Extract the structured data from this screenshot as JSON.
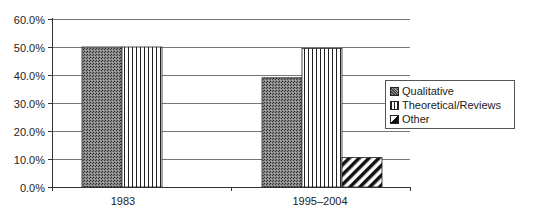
{
  "chart_data": {
    "type": "bar",
    "title": "",
    "xlabel": "",
    "ylabel": "",
    "categories": [
      "1983",
      "1995–2004"
    ],
    "series": [
      {
        "name": "Qualitative",
        "values": [
          50.0,
          39.0
        ],
        "pattern": "dots",
        "color": "#6a6a6a"
      },
      {
        "name": "Theoretical/Reviews",
        "values": [
          50.0,
          49.5
        ],
        "pattern": "vertical-lines",
        "color": "#ffffff"
      },
      {
        "name": "Other",
        "values": [
          null,
          10.5
        ],
        "pattern": "diagonal-lines",
        "color": "#ffffff"
      }
    ],
    "ylim": [
      0,
      60
    ],
    "yticks": [
      "0.0%",
      "10.0%",
      "20.0%",
      "30.0%",
      "40.0%",
      "50.0%",
      "60.0%"
    ],
    "grid": true,
    "legend_position": "right"
  },
  "legend": {
    "items": [
      {
        "label": "Qualitative"
      },
      {
        "label": "Theoretical/Reviews"
      },
      {
        "label": "Other"
      }
    ]
  }
}
